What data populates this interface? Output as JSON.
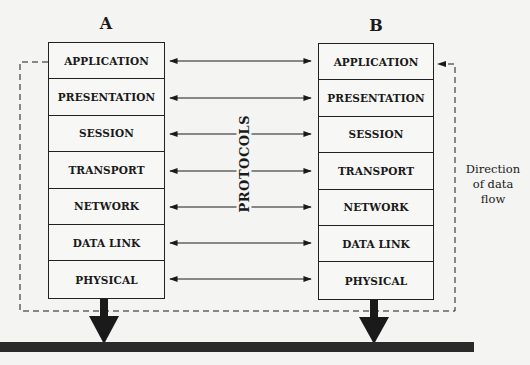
{
  "diagram": {
    "type": "OSI reference model communication between two stations",
    "stations": [
      {
        "id": "A",
        "label": "A"
      },
      {
        "id": "B",
        "label": "B"
      }
    ],
    "layers": [
      "APPLICATION",
      "PRESENTATION",
      "SESSION",
      "TRANSPORT",
      "NETWORK",
      "DATA LINK",
      "PHYSICAL"
    ],
    "center_label": "PROTOCOLS",
    "side_note": {
      "line1": "Direction",
      "line2": "of data",
      "line3": "flow"
    },
    "edges": [
      {
        "from": "A.APPLICATION",
        "to": "B.APPLICATION",
        "style": "double-arrow"
      },
      {
        "from": "A.PRESENTATION",
        "to": "B.PRESENTATION",
        "style": "double-arrow"
      },
      {
        "from": "A.SESSION",
        "to": "B.SESSION",
        "style": "double-arrow"
      },
      {
        "from": "A.TRANSPORT",
        "to": "B.TRANSPORT",
        "style": "double-arrow"
      },
      {
        "from": "A.NETWORK",
        "to": "B.NETWORK",
        "style": "double-arrow"
      },
      {
        "from": "A.DATA LINK",
        "to": "B.DATA LINK",
        "style": "double-arrow"
      },
      {
        "from": "A.PHYSICAL",
        "to": "B.PHYSICAL",
        "style": "double-arrow"
      },
      {
        "from": "A.APPLICATION",
        "to": "B.APPLICATION",
        "style": "dashed-loop-via-medium"
      },
      {
        "from": "A.PHYSICAL",
        "to": "medium",
        "style": "thick-down-arrow"
      },
      {
        "from": "B.PHYSICAL",
        "to": "medium",
        "style": "thick-down-arrow"
      }
    ],
    "colors": {
      "ink": "#1a1a1a",
      "background": "#f4f4f2",
      "medium_bar": "#2a2a2a"
    }
  }
}
